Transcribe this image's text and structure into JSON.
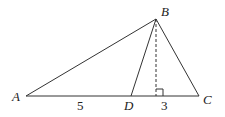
{
  "diagram": {
    "type": "geometry",
    "stroke_color": "#333333",
    "points": {
      "A": {
        "label": "A",
        "x": 26,
        "y": 96
      },
      "B": {
        "label": "B",
        "x": 156,
        "y": 19
      },
      "C": {
        "label": "C",
        "x": 199,
        "y": 96
      },
      "D": {
        "label": "D",
        "x": 131,
        "y": 96
      },
      "H": {
        "x": 156,
        "y": 96
      }
    },
    "segments": [
      {
        "from": "A",
        "to": "B",
        "style": "solid"
      },
      {
        "from": "B",
        "to": "C",
        "style": "solid"
      },
      {
        "from": "A",
        "to": "C",
        "style": "solid"
      },
      {
        "from": "B",
        "to": "D",
        "style": "solid"
      },
      {
        "from": "B",
        "to": "H",
        "style": "dashed"
      }
    ],
    "right_angle_marker": {
      "at": "H"
    },
    "lengths": [
      {
        "segment": "AD",
        "value": "5"
      },
      {
        "segment": "DC",
        "value": "3"
      }
    ]
  }
}
